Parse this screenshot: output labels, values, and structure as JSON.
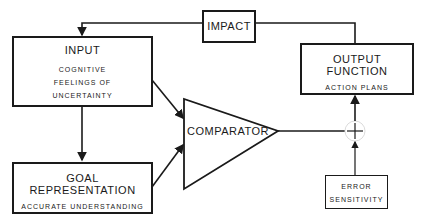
{
  "diagram": {
    "nodes": {
      "input": {
        "title": "INPUT",
        "lines": [
          "COGNITIVE",
          "FEELINGS OF",
          "UNCERTAINTY"
        ]
      },
      "impact": {
        "title": "IMPACT"
      },
      "output": {
        "title": "OUTPUT FUNCTION",
        "subtitle": "ACTION PLANS"
      },
      "goal": {
        "title": "GOAL REPRESENTATION",
        "subtitle": "ACCURATE UNDERSTANDING"
      },
      "comparator": {
        "title": "COMPARATOR"
      },
      "summing": {
        "symbol": "+"
      },
      "error": {
        "lines": [
          "ERROR",
          "SENSITIVITY"
        ]
      }
    },
    "edges": [
      {
        "from": "impact",
        "to": "input"
      },
      {
        "from": "output",
        "to": "impact"
      },
      {
        "from": "input",
        "to": "goal"
      },
      {
        "from": "input",
        "to": "comparator"
      },
      {
        "from": "goal",
        "to": "comparator"
      },
      {
        "from": "comparator",
        "to": "summing"
      },
      {
        "from": "error",
        "to": "summing"
      },
      {
        "from": "summing",
        "to": "output"
      }
    ]
  }
}
